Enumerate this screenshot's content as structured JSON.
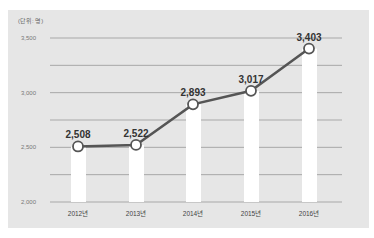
{
  "chart_data": {
    "type": "bar",
    "title": "",
    "unit_label": "(단위: 명)",
    "xlabel": "",
    "ylabel": "",
    "categories": [
      "2012년",
      "2013년",
      "2014년",
      "2015년",
      "2016년"
    ],
    "values": [
      2508,
      2522,
      2893,
      3017,
      3403
    ],
    "value_labels": [
      "2,508",
      "2,522",
      "2,893",
      "3,017",
      "3,403"
    ],
    "overlay_line": true,
    "ylim": [
      2000,
      3500
    ],
    "yticks": [
      2000,
      2500,
      3000,
      3500
    ],
    "ytick_labels": [
      "2,000",
      "2,500",
      "3,000",
      "3,500"
    ],
    "minor_gridlines": [
      2250,
      2750,
      3250
    ],
    "grid": true,
    "colors": {
      "background_panel": "#e6e6e6",
      "bars": "#ffffff",
      "line": "#555555",
      "marker_fill": "#ffffff",
      "gridline": "#a8a8a8"
    }
  }
}
